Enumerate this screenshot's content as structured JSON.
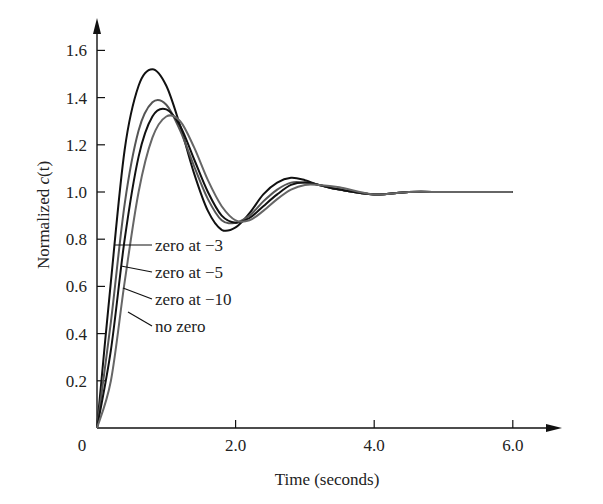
{
  "chart_data": {
    "type": "line",
    "title": "",
    "xlabel": "Time (seconds)",
    "ylabel_prefix": "Normalized ",
    "ylabel_italic": "c",
    "ylabel_suffix": "(t)",
    "xlim": [
      0,
      7
    ],
    "ylim": [
      0,
      1.7
    ],
    "x_ticks": [
      0,
      2.0,
      4.0,
      6.0
    ],
    "x_tick_labels": [
      "0",
      "2.0",
      "4.0",
      "6.0"
    ],
    "y_ticks": [
      0.2,
      0.4,
      0.6,
      0.8,
      1.0,
      1.2,
      1.4,
      1.6
    ],
    "y_tick_labels": [
      "0.2",
      "0.4",
      "0.6",
      "0.8",
      "1.0",
      "1.2",
      "1.4",
      "1.6"
    ],
    "grid": false,
    "legend_position": "inline-callouts",
    "series": [
      {
        "name": "zero at −3",
        "color": "#111111",
        "x": [
          0,
          0.2,
          0.4,
          0.6,
          0.8,
          1.0,
          1.2,
          1.4,
          1.6,
          1.8,
          2.0,
          2.2,
          2.4,
          2.6,
          2.8,
          3.0,
          3.2,
          3.5,
          4.0,
          4.5,
          5.0,
          5.5,
          6.0
        ],
        "values": [
          0,
          0.62,
          1.18,
          1.45,
          1.52,
          1.45,
          1.28,
          1.08,
          0.92,
          0.84,
          0.85,
          0.91,
          0.99,
          1.04,
          1.06,
          1.05,
          1.03,
          1.01,
          0.99,
          1.0,
          1.0,
          1.0,
          1.0
        ]
      },
      {
        "name": "zero at −5",
        "color": "#555555",
        "x": [
          0,
          0.2,
          0.4,
          0.6,
          0.8,
          1.0,
          1.2,
          1.4,
          1.6,
          1.8,
          2.0,
          2.2,
          2.4,
          2.6,
          2.8,
          3.0,
          3.2,
          3.5,
          4.0,
          4.5,
          5.0,
          5.5,
          6.0
        ],
        "values": [
          0,
          0.45,
          0.95,
          1.26,
          1.38,
          1.37,
          1.26,
          1.11,
          0.97,
          0.88,
          0.87,
          0.9,
          0.96,
          1.01,
          1.04,
          1.04,
          1.03,
          1.01,
          0.99,
          1.0,
          1.0,
          1.0,
          1.0
        ]
      },
      {
        "name": "zero at −10",
        "color": "#111111",
        "x": [
          0,
          0.2,
          0.4,
          0.6,
          0.8,
          1.0,
          1.2,
          1.4,
          1.6,
          1.8,
          2.0,
          2.2,
          2.4,
          2.6,
          2.8,
          3.0,
          3.2,
          3.5,
          4.0,
          4.5,
          5.0,
          5.5,
          6.0
        ],
        "values": [
          0,
          0.33,
          0.8,
          1.15,
          1.32,
          1.35,
          1.28,
          1.14,
          1.0,
          0.9,
          0.87,
          0.89,
          0.94,
          0.99,
          1.03,
          1.04,
          1.03,
          1.01,
          0.99,
          1.0,
          1.0,
          1.0,
          1.0
        ]
      },
      {
        "name": "no zero",
        "color": "#666666",
        "x": [
          0,
          0.2,
          0.4,
          0.6,
          0.8,
          1.0,
          1.2,
          1.4,
          1.6,
          1.8,
          2.0,
          2.2,
          2.4,
          2.6,
          2.8,
          3.0,
          3.2,
          3.5,
          4.0,
          4.5,
          5.0,
          5.5,
          6.0
        ],
        "values": [
          0,
          0.2,
          0.62,
          1.0,
          1.23,
          1.32,
          1.3,
          1.19,
          1.05,
          0.94,
          0.88,
          0.88,
          0.92,
          0.97,
          1.01,
          1.03,
          1.03,
          1.02,
          0.99,
          1.0,
          1.0,
          1.0,
          1.0
        ]
      }
    ],
    "annotations": [
      {
        "text": "zero at −3",
        "series": 0
      },
      {
        "text": "zero at −5",
        "series": 1
      },
      {
        "text": "zero at −10",
        "series": 2
      },
      {
        "text": "no zero",
        "series": 3
      }
    ]
  }
}
